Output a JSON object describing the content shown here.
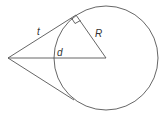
{
  "diagram": {
    "type": "tangent-circle-geometry",
    "labels": {
      "tangent": "t",
      "radius": "R",
      "distance": "d"
    },
    "colors": {
      "stroke": "#555555",
      "label": "#333333",
      "background": "#ffffff"
    },
    "elements": [
      "circle",
      "upper tangent line from external point",
      "lower tangent line from external point",
      "radius to tangent point",
      "line from external point to center",
      "right-angle marker at tangent point"
    ]
  }
}
